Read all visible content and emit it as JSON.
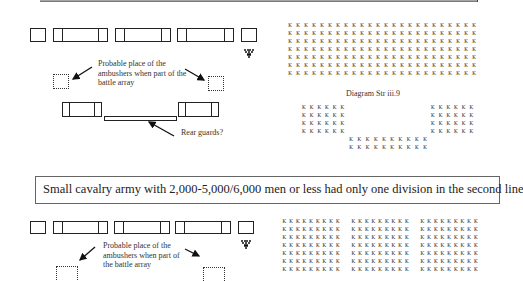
{
  "top_diagram": {
    "note_ambushers": [
      "Probable place of the",
      "ambushers when part of the",
      "battle array"
    ],
    "note_rear_guards": "Rear guards?",
    "diagram_label": "Diagram Str iii.9",
    "grid_char": "K",
    "main_grid": {
      "rows": 7,
      "cols": 24
    },
    "left_wing": {
      "rows": 4,
      "cols": 6
    },
    "right_wing": {
      "rows": 4,
      "cols": 6
    },
    "center_rear": {
      "rows": 2,
      "cols": 10
    }
  },
  "caption": "Small cavalry army with 2,000-5,000/6,000 men or less had only one division in the second line",
  "bottom_diagram": {
    "note_ambushers": [
      "Probable place of the",
      "ambushers when part of",
      "the battle array"
    ],
    "grid_char": "K",
    "blocks": [
      {
        "rows": 7,
        "cols": 9
      },
      {
        "rows": 7,
        "cols": 9
      },
      {
        "rows": 7,
        "cols": 9
      }
    ]
  }
}
